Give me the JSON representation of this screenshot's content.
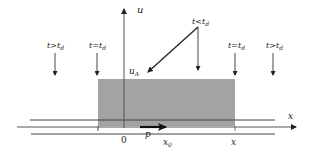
{
  "diagram": {
    "axes": {
      "vertical_label": "u",
      "horizontal_label": "x",
      "origin_label": "0"
    },
    "region": {
      "level_label": "u",
      "level_sub": "A",
      "fill_color": "#a3a3a3"
    },
    "markers": {
      "p_label": "p",
      "x0_label": "x",
      "x0_sub": "0",
      "x_tick_label": "x"
    },
    "time_labels": [
      {
        "main": "t>t",
        "sub": "d"
      },
      {
        "main": "t=t",
        "sub": "d"
      },
      {
        "main": "t<t",
        "sub": "d"
      },
      {
        "main": "t=t",
        "sub": "d"
      },
      {
        "main": "t>t",
        "sub": "d"
      }
    ]
  }
}
